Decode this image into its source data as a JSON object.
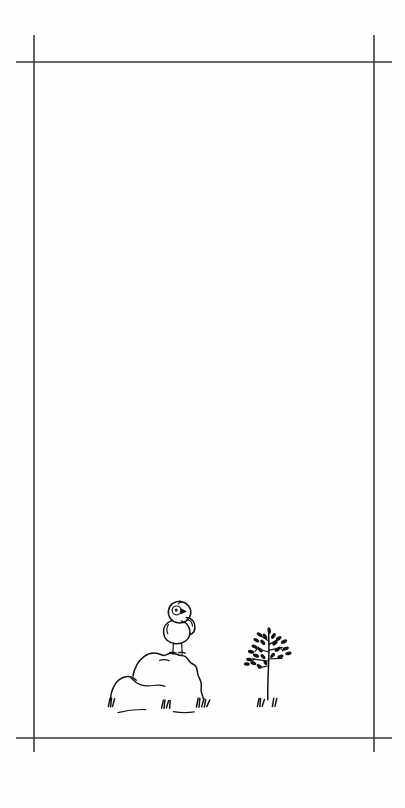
{
  "page": {
    "width": 405,
    "height": 808,
    "paper_color": "#fefefe",
    "ink_color": "#131313",
    "crop_mark_color": "#3a3a3a",
    "caption": ""
  },
  "crop_marks": {
    "label": "registration crop marks",
    "frame": {
      "left_x": 34,
      "right_x": 374,
      "top_y": 62,
      "bottom_y": 738
    },
    "overhang": {
      "vertical_top": 35,
      "vertical_bottom": 750,
      "horizontal_left": 16,
      "horizontal_right": 392
    },
    "corners": [
      {
        "name": "top-left",
        "x": 34,
        "y": 62
      },
      {
        "name": "top-right",
        "x": 374,
        "y": 62
      },
      {
        "name": "bottom-left",
        "x": 34,
        "y": 738
      },
      {
        "name": "bottom-right",
        "x": 374,
        "y": 738
      }
    ]
  },
  "artwork": {
    "medium": "pen and ink line drawing",
    "subject": "a small round bird perched on a rock beside a young sapling",
    "placement": "lower center of the page",
    "elements": [
      {
        "id": "bird",
        "name": "bird",
        "description": "small round fledgling bird standing on top of the rock, facing right",
        "parts": [
          "head",
          "eye",
          "beak",
          "body",
          "wing",
          "left-leg",
          "right-leg",
          "feet"
        ],
        "bbox": {
          "x": 163,
          "y": 600,
          "width": 42,
          "height": 52
        }
      },
      {
        "id": "rock",
        "name": "rock",
        "description": "large boulder formed of two overlapping rounded mounds, the smaller on the left",
        "parts": [
          "left-mound",
          "right-mound",
          "interior-crease"
        ],
        "bbox": {
          "x": 108,
          "y": 648,
          "width": 110,
          "height": 56
        }
      },
      {
        "id": "ground-grass",
        "name": "grass tufts at rock base",
        "description": "short grass tufts and a faint ground line under the rock",
        "tuft_count": 4,
        "bbox": {
          "x": 104,
          "y": 695,
          "width": 116,
          "height": 20
        }
      },
      {
        "id": "sapling",
        "name": "sapling",
        "description": "slender young tree with a straight stem and paired branches bearing small dark oval leaves",
        "leaf_count": 24,
        "branch_count": 7,
        "bbox": {
          "x": 240,
          "y": 628,
          "width": 60,
          "height": 82
        }
      },
      {
        "id": "sapling-grass",
        "name": "grass tufts at sapling base",
        "description": "two small grass tufts flanking the sapling stem",
        "tuft_count": 2,
        "bbox": {
          "x": 252,
          "y": 696,
          "width": 30,
          "height": 14
        }
      }
    ]
  }
}
